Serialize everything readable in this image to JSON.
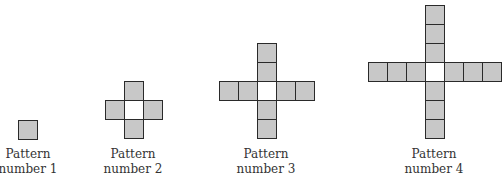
{
  "colors": {
    "filled": "#c8c8c8",
    "center": "#ffffff",
    "border": "#2a2a2a",
    "text": "#333333"
  },
  "cell_size": 19,
  "patterns": [
    {
      "line1": "Pattern",
      "line2": "number 1",
      "arm_length": 0,
      "center": [
        18,
        120
      ],
      "label_center_x": 28,
      "label_top": 147,
      "center_shaded": true
    },
    {
      "line1": "Pattern",
      "line2": "number 2",
      "arm_length": 1,
      "center": [
        124,
        100
      ],
      "label_center_x": 133,
      "label_top": 147
    },
    {
      "line1": "Pattern",
      "line2": "number 3",
      "arm_length": 2,
      "center": [
        257,
        81
      ],
      "label_center_x": 266,
      "label_top": 147
    },
    {
      "line1": "Pattern",
      "line2": "number 4",
      "arm_length": 3,
      "center": [
        425,
        62
      ],
      "label_center_x": 434,
      "label_top": 147
    }
  ]
}
